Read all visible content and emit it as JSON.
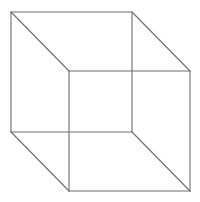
{
  "diagram": {
    "line_color": "#6e6e6e",
    "background_color": "#ffffff",
    "faces": [
      "back-square",
      "front-square"
    ],
    "edges": [
      {
        "name": "back-top-edge",
        "face": "back"
      },
      {
        "name": "back-right-edge",
        "face": "back"
      },
      {
        "name": "back-bottom-edge",
        "face": "back"
      },
      {
        "name": "back-left-edge",
        "face": "back"
      },
      {
        "name": "front-top-edge",
        "face": "front"
      },
      {
        "name": "front-right-edge",
        "face": "front"
      },
      {
        "name": "front-bottom-edge",
        "face": "front"
      },
      {
        "name": "front-left-edge",
        "face": "front"
      },
      {
        "name": "top-left-connector",
        "face": "connector"
      },
      {
        "name": "top-right-connector",
        "face": "connector"
      },
      {
        "name": "bottom-right-connector",
        "face": "connector"
      },
      {
        "name": "bottom-left-connector",
        "face": "connector"
      }
    ]
  }
}
